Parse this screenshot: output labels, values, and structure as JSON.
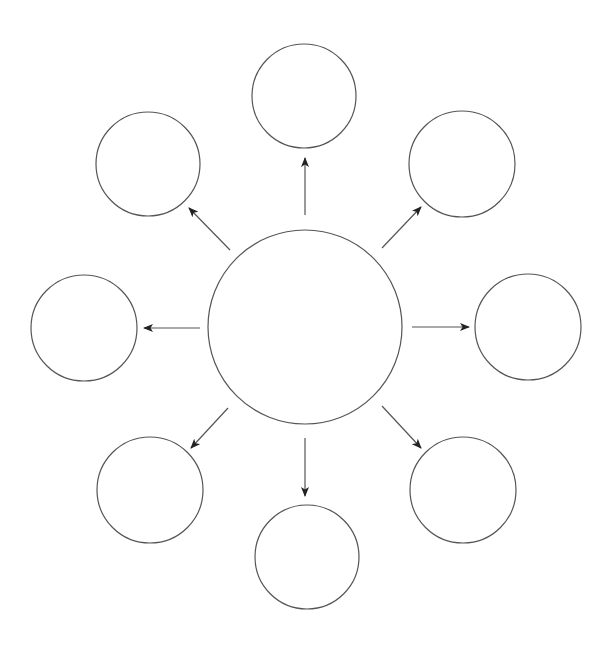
{
  "diagram": {
    "type": "hub-and-spoke",
    "stroke_color": "#555555",
    "arrow_color": "#222222",
    "background": "#ffffff",
    "hub": {
      "id": "hub",
      "cx": 305,
      "cy": 327,
      "r": 97,
      "label": ""
    },
    "nodes": [
      {
        "id": "top",
        "cx": 304,
        "cy": 96,
        "r": 52,
        "label": ""
      },
      {
        "id": "top-right",
        "cx": 462,
        "cy": 164,
        "r": 53,
        "label": ""
      },
      {
        "id": "right",
        "cx": 528,
        "cy": 327,
        "r": 53,
        "label": ""
      },
      {
        "id": "bottom-right",
        "cx": 463,
        "cy": 490,
        "r": 53,
        "label": ""
      },
      {
        "id": "bottom",
        "cx": 307,
        "cy": 557,
        "r": 52,
        "label": ""
      },
      {
        "id": "bottom-left",
        "cx": 150,
        "cy": 490,
        "r": 53,
        "label": ""
      },
      {
        "id": "left",
        "cx": 84,
        "cy": 328,
        "r": 53,
        "label": ""
      },
      {
        "id": "top-left",
        "cx": 148,
        "cy": 164,
        "r": 52,
        "label": ""
      }
    ],
    "arrows": [
      {
        "id": "arrow-top",
        "from": "hub",
        "to": "top",
        "x1": 305,
        "y1": 215,
        "x2": 305,
        "y2": 158
      },
      {
        "id": "arrow-top-right",
        "from": "hub",
        "to": "top-right",
        "x1": 382,
        "y1": 248,
        "x2": 421,
        "y2": 207
      },
      {
        "id": "arrow-right",
        "from": "hub",
        "to": "right",
        "x1": 412,
        "y1": 327,
        "x2": 469,
        "y2": 327
      },
      {
        "id": "arrow-bottom-right",
        "from": "hub",
        "to": "bottom-right",
        "x1": 382,
        "y1": 406,
        "x2": 421,
        "y2": 448
      },
      {
        "id": "arrow-bottom",
        "from": "hub",
        "to": "bottom",
        "x1": 305,
        "y1": 438,
        "x2": 305,
        "y2": 496
      },
      {
        "id": "arrow-bottom-left",
        "from": "hub",
        "to": "bottom-left",
        "x1": 228,
        "y1": 408,
        "x2": 191,
        "y2": 448
      },
      {
        "id": "arrow-left",
        "from": "hub",
        "to": "left",
        "x1": 200,
        "y1": 328,
        "x2": 144,
        "y2": 328
      },
      {
        "id": "arrow-top-left",
        "from": "hub",
        "to": "top-left",
        "x1": 230,
        "y1": 250,
        "x2": 189,
        "y2": 208
      }
    ]
  }
}
